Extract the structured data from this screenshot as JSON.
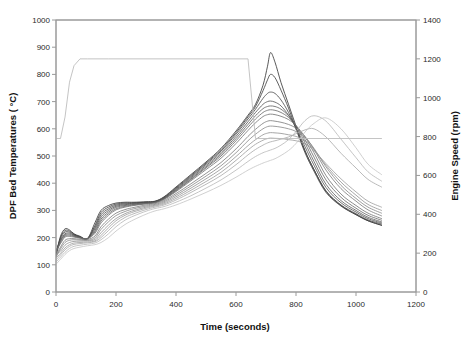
{
  "chart_data": {
    "type": "line",
    "title": "",
    "xlabel": "Time (seconds)",
    "ylabel": "DPF Bed Temperatures ( °C)",
    "y2label": "Engine Speed (rpm)",
    "xlim": [
      0,
      1200
    ],
    "ylim": [
      0,
      1000
    ],
    "y2lim": [
      0,
      1400
    ],
    "xticks": [
      0,
      200,
      400,
      600,
      800,
      1000,
      1200
    ],
    "yticks": [
      0,
      100,
      200,
      300,
      400,
      500,
      600,
      700,
      800,
      900,
      1000
    ],
    "y2ticks": [
      0,
      200,
      400,
      600,
      800,
      1000,
      1200,
      1400
    ],
    "grid": false,
    "legend": "none",
    "x": [
      0,
      15,
      30,
      45,
      60,
      80,
      105,
      130,
      150,
      175,
      200,
      230,
      260,
      300,
      330,
      360,
      400,
      450,
      500,
      550,
      600,
      640,
      665,
      690,
      705,
      715,
      730,
      750,
      775,
      800,
      830,
      860,
      900,
      950,
      1000,
      1040,
      1085
    ],
    "series": [
      {
        "name": "DPF Bed Temp 1",
        "axis": "left",
        "color": "#2e2e2e",
        "values": [
          137,
          205,
          232,
          228,
          214,
          205,
          197,
          255,
          300,
          318,
          327,
          330,
          330,
          332,
          334,
          350,
          386,
          432,
          478,
          528,
          592,
          650,
          690,
          760,
          830,
          880,
          845,
          770,
          690,
          610,
          520,
          450,
          370,
          318,
          285,
          262,
          245
        ]
      },
      {
        "name": "DPF Bed Temp 2",
        "axis": "left",
        "color": "#383838",
        "values": [
          140,
          200,
          226,
          224,
          212,
          203,
          196,
          245,
          292,
          312,
          323,
          327,
          328,
          330,
          333,
          348,
          383,
          428,
          474,
          523,
          586,
          644,
          682,
          740,
          780,
          800,
          788,
          742,
          676,
          600,
          512,
          444,
          366,
          316,
          284,
          262,
          246
        ]
      },
      {
        "name": "DPF Bed Temp 3",
        "axis": "left",
        "color": "#454545",
        "values": [
          143,
          195,
          220,
          220,
          210,
          202,
          196,
          238,
          284,
          306,
          319,
          324,
          326,
          329,
          332,
          346,
          380,
          424,
          470,
          518,
          580,
          636,
          672,
          712,
          730,
          735,
          730,
          706,
          660,
          600,
          518,
          450,
          372,
          320,
          288,
          265,
          250
        ]
      },
      {
        "name": "DPF Bed Temp 4",
        "axis": "left",
        "color": "#505050",
        "values": [
          150,
          190,
          214,
          216,
          208,
          201,
          197,
          232,
          276,
          300,
          315,
          321,
          324,
          328,
          331,
          345,
          377,
          420,
          465,
          512,
          572,
          626,
          660,
          690,
          700,
          702,
          698,
          684,
          650,
          604,
          534,
          466,
          384,
          328,
          294,
          270,
          254
        ]
      },
      {
        "name": "DPF Bed Temp 5",
        "axis": "left",
        "color": "#5a5a5a",
        "values": [
          134,
          186,
          210,
          212,
          206,
          200,
          196,
          226,
          268,
          294,
          311,
          318,
          322,
          326,
          330,
          343,
          374,
          416,
          460,
          506,
          564,
          616,
          648,
          674,
          682,
          684,
          682,
          672,
          648,
          610,
          548,
          480,
          396,
          336,
          300,
          275,
          258
        ]
      },
      {
        "name": "DPF Bed Temp 6",
        "axis": "left",
        "color": "#646464",
        "values": [
          146,
          182,
          206,
          208,
          204,
          199,
          196,
          221,
          261,
          288,
          306,
          315,
          320,
          325,
          329,
          342,
          372,
          413,
          456,
          500,
          556,
          606,
          636,
          660,
          668,
          670,
          668,
          660,
          642,
          612,
          560,
          496,
          412,
          348,
          308,
          282,
          264
        ]
      },
      {
        "name": "DPF Bed Temp 7",
        "axis": "left",
        "color": "#6e6e6e",
        "values": [
          152,
          178,
          202,
          204,
          202,
          198,
          196,
          216,
          254,
          282,
          302,
          312,
          318,
          324,
          328,
          340,
          369,
          409,
          450,
          492,
          546,
          594,
          622,
          645,
          652,
          654,
          652,
          646,
          634,
          612,
          570,
          512,
          428,
          360,
          318,
          290,
          270
        ]
      },
      {
        "name": "DPF Bed Temp 8",
        "axis": "left",
        "color": "#787878",
        "values": [
          132,
          165,
          190,
          196,
          196,
          194,
          193,
          206,
          240,
          268,
          290,
          303,
          311,
          320,
          325,
          336,
          362,
          398,
          436,
          476,
          526,
          572,
          598,
          620,
          628,
          630,
          628,
          624,
          616,
          602,
          572,
          524,
          448,
          380,
          334,
          302,
          280
        ]
      },
      {
        "name": "DPF Bed Temp 9",
        "axis": "left",
        "color": "#858585",
        "values": [
          128,
          158,
          182,
          190,
          192,
          191,
          190,
          199,
          230,
          258,
          281,
          296,
          306,
          316,
          322,
          332,
          356,
          390,
          426,
          464,
          512,
          556,
          580,
          600,
          608,
          610,
          609,
          606,
          600,
          590,
          568,
          528,
          460,
          392,
          344,
          312,
          290
        ]
      },
      {
        "name": "DPF Bed Temp 10",
        "axis": "left",
        "color": "#909090",
        "values": [
          138,
          150,
          172,
          182,
          186,
          187,
          188,
          193,
          218,
          246,
          270,
          288,
          300,
          312,
          319,
          328,
          350,
          382,
          416,
          452,
          498,
          538,
          560,
          578,
          584,
          586,
          585,
          583,
          578,
          572,
          556,
          524,
          466,
          404,
          356,
          322,
          300
        ]
      },
      {
        "name": "DPF Bed Temp 11",
        "axis": "left",
        "color": "#9c9c9c",
        "values": [
          125,
          142,
          162,
          174,
          180,
          182,
          184,
          188,
          208,
          236,
          262,
          282,
          295,
          308,
          316,
          324,
          344,
          374,
          406,
          440,
          484,
          522,
          543,
          558,
          564,
          566,
          565,
          564,
          560,
          556,
          545,
          520,
          472,
          416,
          368,
          334,
          312
        ]
      },
      {
        "name": "DPF Bed Temp 12",
        "axis": "left",
        "color": "#a8a8a8",
        "values": [
          118,
          136,
          155,
          168,
          175,
          178,
          181,
          185,
          200,
          226,
          252,
          274,
          288,
          303,
          312,
          320,
          338,
          366,
          396,
          428,
          468,
          504,
          524,
          540,
          548,
          552,
          556,
          562,
          570,
          582,
          596,
          600,
          570,
          510,
          456,
          414,
          386
        ]
      },
      {
        "name": "DPF Bed Temp 13",
        "axis": "left",
        "color": "#b6b6b6",
        "values": [
          110,
          128,
          146,
          160,
          168,
          172,
          176,
          180,
          192,
          214,
          240,
          264,
          280,
          297,
          307,
          314,
          330,
          354,
          382,
          412,
          448,
          480,
          498,
          512,
          518,
          522,
          528,
          540,
          560,
          590,
          630,
          648,
          628,
          562,
          494,
          442,
          408
        ]
      },
      {
        "name": "DPF Bed Temp 14",
        "axis": "left",
        "color": "#c4c4c4",
        "values": [
          102,
          120,
          138,
          152,
          160,
          165,
          170,
          174,
          182,
          200,
          224,
          248,
          266,
          286,
          298,
          306,
          320,
          342,
          366,
          392,
          422,
          448,
          462,
          474,
          480,
          484,
          490,
          502,
          520,
          546,
          588,
          620,
          640,
          600,
          530,
          470,
          432
        ]
      },
      {
        "name": "Engine Speed",
        "axis": "right",
        "color": "#bdbdbd",
        "values": [
          790,
          790,
          900,
          1080,
          1165,
          1200,
          1200,
          1200,
          1200,
          1200,
          1200,
          1200,
          1200,
          1200,
          1200,
          1200,
          1200,
          1200,
          1200,
          1200,
          1200,
          1200,
          790,
          790,
          790,
          790,
          790,
          790,
          790,
          790,
          790,
          790,
          790,
          790,
          790,
          790,
          790
        ]
      }
    ]
  },
  "axes": {
    "x_tick_labels": [
      "0",
      "200",
      "400",
      "600",
      "800",
      "1000",
      "1200"
    ],
    "y_tick_labels": [
      "0",
      "100",
      "200",
      "300",
      "400",
      "500",
      "600",
      "700",
      "800",
      "900",
      "1000"
    ],
    "y2_tick_labels": [
      "0",
      "200",
      "400",
      "600",
      "800",
      "1000",
      "1200",
      "1400"
    ],
    "x_title": "Time (seconds)",
    "y_title": "DPF Bed Temperatures ( °C)",
    "y2_title": "Engine Speed (rpm)"
  }
}
